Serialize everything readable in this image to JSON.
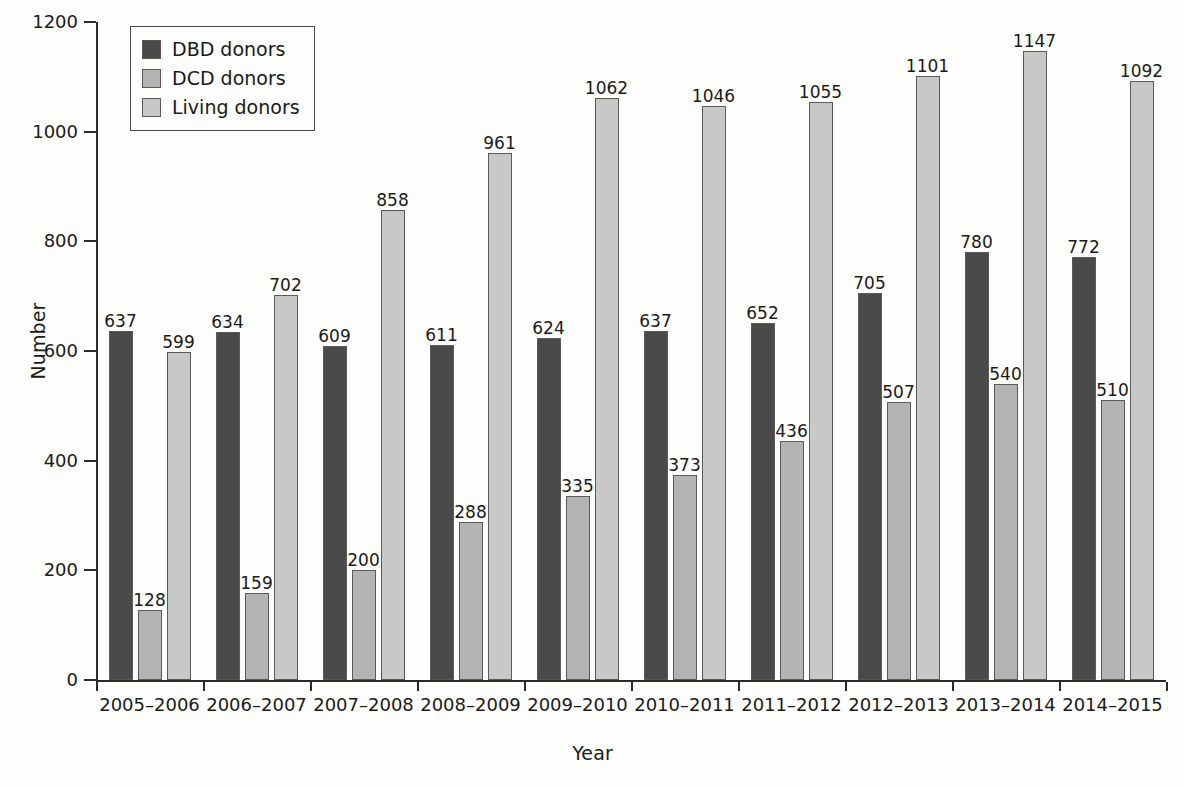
{
  "chart_data": {
    "type": "bar",
    "title": "",
    "xlabel": "Year",
    "ylabel": "Number",
    "ylim": [
      0,
      1200
    ],
    "yticks": [
      0,
      200,
      400,
      600,
      800,
      1000,
      1200
    ],
    "grid": false,
    "legend_position": "top-left",
    "categories": [
      "2005–2006",
      "2006–2007",
      "2007–2008",
      "2008–2009",
      "2009–2010",
      "2010–2011",
      "2011–2012",
      "2012–2013",
      "2013–2014",
      "2014–2015"
    ],
    "series": [
      {
        "name": "DBD donors",
        "color": "#4a4a4a",
        "values": [
          637,
          634,
          609,
          611,
          624,
          637,
          652,
          705,
          780,
          772
        ]
      },
      {
        "name": "DCD donors",
        "color": "#b4b4b4",
        "values": [
          128,
          159,
          200,
          288,
          335,
          373,
          436,
          507,
          540,
          510
        ]
      },
      {
        "name": "Living donors",
        "color": "#c8c8c8",
        "values": [
          599,
          702,
          858,
          961,
          1062,
          1046,
          1055,
          1101,
          1147,
          1092
        ]
      }
    ]
  }
}
